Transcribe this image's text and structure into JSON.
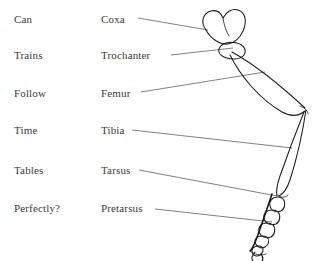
{
  "page": {
    "background_color": "#ffffff",
    "text_color": "#3a3a3a",
    "line_color": "#1a1a1a"
  },
  "mnemonic_column": {
    "name": "mnemonic-phrase",
    "items": [
      {
        "label": "Can"
      },
      {
        "label": "Trains"
      },
      {
        "label": "Follow"
      },
      {
        "label": "Time"
      },
      {
        "label": "Tables"
      },
      {
        "label": "Perfectly?"
      }
    ]
  },
  "term_column": {
    "name": "anatomical-terms",
    "items": [
      {
        "label": "Coxa"
      },
      {
        "label": "Trochanter"
      },
      {
        "label": "Femur"
      },
      {
        "label": "Tibia"
      },
      {
        "label": "Tarsus"
      },
      {
        "label": "Pretarsus"
      }
    ]
  },
  "diagram": {
    "name": "insect-leg-illustration",
    "segments": [
      "coxa",
      "trochanter",
      "femur",
      "tibia",
      "tarsus",
      "pretarsus"
    ]
  }
}
